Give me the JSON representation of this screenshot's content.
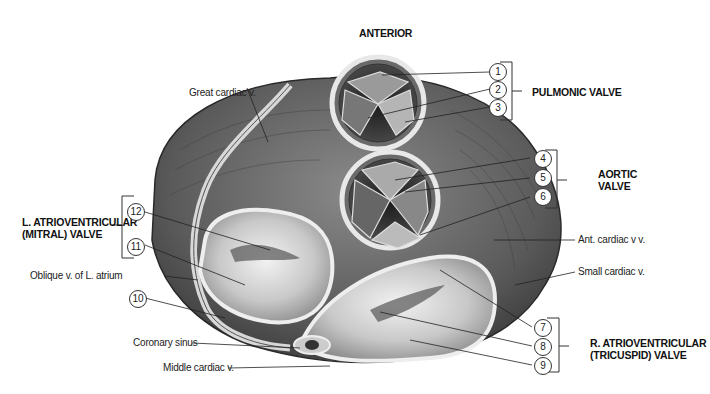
{
  "figure": {
    "orientation_label": "ANTERIOR",
    "groups": {
      "pulmonic": "PULMONIC VALVE",
      "aortic": "AORTIC\nVALVE",
      "mitral": "L. ATRIOVENTRICULAR\n(MITRAL) VALVE",
      "tricuspid": "R. ATRIOVENTRICULAR\n(TRICUSPID) VALVE"
    },
    "numbers": [
      "1",
      "2",
      "3",
      "4",
      "5",
      "6",
      "7",
      "8",
      "9",
      "10",
      "11",
      "12"
    ],
    "labels": {
      "great_cardiac": "Great cardiac v.",
      "ant_cardiac": "Ant. cardiac v v.",
      "small_cardiac": "Small cardiac v.",
      "oblique": "Oblique v. of L. atrium",
      "coronary_sinus": "Coronary sinus",
      "middle_cardiac": "Middle cardiac v."
    }
  }
}
